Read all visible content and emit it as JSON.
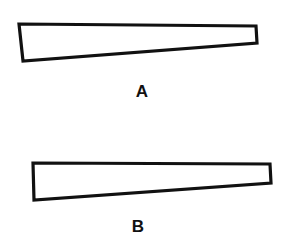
{
  "figures": [
    {
      "label": "A",
      "points": "19,24 256,26 257,43 23,61",
      "label_x": 142,
      "label_y": 97
    },
    {
      "label": "B",
      "points": "33,163 270,164 271,183 34,200",
      "label_x": 138,
      "label_y": 232
    }
  ],
  "colors": {
    "stroke": "#111111",
    "background": "#ffffff"
  }
}
